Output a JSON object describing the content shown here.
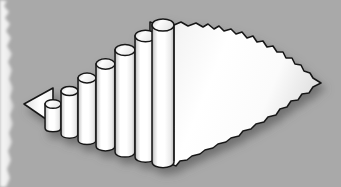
{
  "artwork": {
    "title": "Ascending 3D cylinder bar chart on torn paper",
    "kind": "clipart-illustration",
    "caption": "",
    "background_color": "#a9a9a9",
    "paper_fill_light": "#ffffff",
    "paper_fill_shade": "#d9d9d9",
    "outline_color": "#1a1a1a",
    "shadow_color": "#6e6e6e",
    "canvas": {
      "width": 341,
      "height": 187
    }
  },
  "chart_data": {
    "type": "bar",
    "title": "Ascending 3D cylinder bar chart on torn paper",
    "xlabel": "",
    "ylabel": "",
    "categories": [
      "1",
      "2",
      "3",
      "4",
      "5",
      "6",
      "7"
    ],
    "values": [
      22,
      34,
      47,
      60,
      73,
      87,
      100
    ],
    "ylim": [
      0,
      100
    ],
    "grid": false,
    "legend": false,
    "bar_style": "3d-cylinder",
    "orientation": "vertical",
    "series": [
      {
        "name": "Growth",
        "values": [
          22,
          34,
          47,
          60,
          73,
          87,
          100
        ]
      }
    ],
    "annotations": [],
    "tick_labels": {
      "x": [],
      "y": []
    },
    "bars_px": [
      {
        "index": 1,
        "x": 45,
        "top": 101,
        "bottom": 131,
        "width": 16
      },
      {
        "index": 2,
        "x": 60,
        "top": 88,
        "bottom": 137,
        "width": 17
      },
      {
        "index": 3,
        "x": 76,
        "top": 75,
        "bottom": 143,
        "width": 18
      },
      {
        "index": 4,
        "x": 93,
        "top": 62,
        "bottom": 149,
        "width": 19
      },
      {
        "index": 5,
        "x": 111,
        "top": 48,
        "bottom": 155,
        "width": 20
      },
      {
        "index": 6,
        "x": 129,
        "top": 34,
        "bottom": 160,
        "width": 21
      },
      {
        "index": 7,
        "x": 148,
        "top": 23,
        "bottom": 166,
        "width": 22
      }
    ]
  },
  "shape": {
    "left_tip": {
      "x": 24,
      "y": 104
    },
    "right_tip": {
      "x": 321,
      "y": 83
    },
    "left_strip": {
      "x": 0,
      "width": 11,
      "color": "#f2f2f2"
    }
  }
}
